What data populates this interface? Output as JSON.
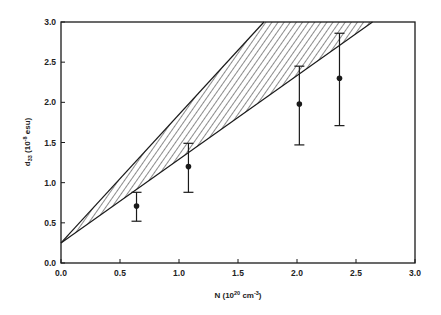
{
  "chart_data": {
    "type": "scatter",
    "title": "",
    "xlabel": "N (10^20 cm^-3)",
    "ylabel": "d33 (10^-8 esu)",
    "xlabel_parts": {
      "main": "N (10",
      "exp1": "20",
      "mid": " cm",
      "exp2": "-3",
      "end": ")"
    },
    "ylabel_parts": {
      "main": "d",
      "sub": "33",
      "mid": " (10",
      "exp": "-8",
      "end": " esu)"
    },
    "xlim": [
      0.0,
      3.0
    ],
    "ylim": [
      0.0,
      3.0
    ],
    "xticks": [
      "0.0",
      "0.5",
      "1.0",
      "1.5",
      "2.0",
      "2.5",
      "3.0"
    ],
    "yticks": [
      "0.0",
      "0.5",
      "1.0",
      "1.5",
      "2.0",
      "2.5",
      "3.0"
    ],
    "grid": false,
    "legend": null,
    "series": [
      {
        "name": "measured d33",
        "marker": "filled-circle",
        "x": [
          0.64,
          1.08,
          2.02,
          2.36
        ],
        "y": [
          0.71,
          1.2,
          1.98,
          2.3
        ],
        "err_upper": [
          0.88,
          1.49,
          2.45,
          2.86
        ],
        "err_lower": [
          0.52,
          0.88,
          1.47,
          1.71
        ]
      }
    ],
    "band": {
      "name": "theoretical range (hatched)",
      "upper_line": {
        "x": [
          0.0,
          1.72
        ],
        "y": [
          0.25,
          3.0
        ]
      },
      "lower_line": {
        "x": [
          0.0,
          2.64
        ],
        "y": [
          0.25,
          3.0
        ]
      },
      "fill": "diagonal-hatch"
    }
  },
  "colors": {
    "ink": "#1a1a1a",
    "background": "#ffffff"
  }
}
